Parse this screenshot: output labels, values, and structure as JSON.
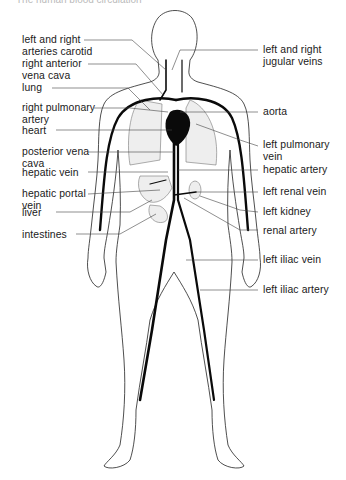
{
  "diagram": {
    "title_partial": "The human blood circulation",
    "colors": {
      "outline": "#222222",
      "vessel": "#0a0a0a",
      "leader": "#444444",
      "organ_fill": "#eeeeee",
      "background": "#ffffff"
    },
    "labels_left": [
      {
        "id": "carotid",
        "line1": "left and right",
        "line2": "arteries carotid"
      },
      {
        "id": "ant-vena-cava",
        "line1": "right anterior",
        "line2": "vena cava"
      },
      {
        "id": "lung",
        "line1": "lung",
        "line2": ""
      },
      {
        "id": "r-pulm-artery",
        "line1": "right pulmonary",
        "line2": "artery"
      },
      {
        "id": "heart",
        "line1": "heart",
        "line2": ""
      },
      {
        "id": "post-vena-cava",
        "line1": "posterior vena",
        "line2": "cava"
      },
      {
        "id": "hepatic-vein",
        "line1": "hepatic vein",
        "line2": ""
      },
      {
        "id": "hepatic-portal",
        "line1": "hepatic portal",
        "line2": "vein"
      },
      {
        "id": "liver",
        "line1": "liver",
        "line2": ""
      },
      {
        "id": "intestines",
        "line1": "intestines",
        "line2": ""
      }
    ],
    "labels_right": [
      {
        "id": "jugular",
        "line1": "left and right",
        "line2": "jugular veins"
      },
      {
        "id": "aorta",
        "line1": "aorta",
        "line2": ""
      },
      {
        "id": "l-pulm-vein",
        "line1": "left pulmonary",
        "line2": "vein"
      },
      {
        "id": "hepatic-artery",
        "line1": "hepatic artery",
        "line2": ""
      },
      {
        "id": "l-renal-vein",
        "line1": "left renal vein",
        "line2": ""
      },
      {
        "id": "l-kidney",
        "line1": "left kidney",
        "line2": ""
      },
      {
        "id": "renal-artery",
        "line1": "renal artery",
        "line2": ""
      },
      {
        "id": "l-iliac-vein",
        "line1": "left iliac vein",
        "line2": ""
      },
      {
        "id": "l-iliac-artery",
        "line1": "left iliac artery",
        "line2": ""
      }
    ]
  }
}
